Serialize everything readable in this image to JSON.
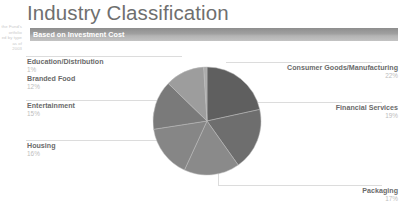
{
  "page": {
    "title": "Industry Classification",
    "subtitle": "Based on Investment Cost"
  },
  "margin_note": {
    "line1": "the Fund's",
    "line2": "ortfolio",
    "line3": "ed by type",
    "line4": "as of",
    "line5": "2003"
  },
  "colors": {
    "title": "#6f6f6f",
    "bar_dark": "#8e8e8e",
    "bar_light": "#c3c3c3",
    "label_name": "#6a6a6a",
    "label_pct": "#bdbdbd",
    "leader_line": "#dcdcdc",
    "slice_consumer_goods": "#5f5f5f",
    "slice_financial_services": "#6e6e6e",
    "slice_packaging": "#8a8a8a",
    "slice_housing": "#868686",
    "slice_entertainment": "#7a7a7a",
    "slice_branded_food": "#9d9d9d",
    "slice_education_distribution": "#acacac"
  },
  "chart_data": {
    "type": "pie",
    "title": "Industry Classification",
    "subtitle": "Based on Investment Cost",
    "unit": "%",
    "total": 102,
    "start_angle_deg": 0,
    "direction": "clockwise",
    "legend_position": "callout-labels",
    "grid": false,
    "categories": [
      "Consumer Goods/Manufacturing",
      "Financial Services",
      "Packaging",
      "Housing",
      "Entertainment",
      "Branded Food",
      "Education/Distribution"
    ],
    "values": [
      22,
      19,
      17,
      16,
      15,
      12,
      1
    ],
    "labels": [
      "Consumer Goods/Manufacturing",
      "Financial Services",
      "Packaging",
      "Housing",
      "Entertainment",
      "Branded Food",
      "Education/Distribution"
    ],
    "slices": [
      {
        "label": "Consumer Goods/Manufacturing",
        "value": 22,
        "display": "22%",
        "color": "#5f5f5f",
        "side": "right"
      },
      {
        "label": "Financial Services",
        "value": 19,
        "display": "19%",
        "color": "#6e6e6e",
        "side": "right"
      },
      {
        "label": "Packaging",
        "value": 17,
        "display": "17%",
        "color": "#8a8a8a",
        "side": "right"
      },
      {
        "label": "Housing",
        "value": 16,
        "display": "16%",
        "color": "#868686",
        "side": "left"
      },
      {
        "label": "Entertainment",
        "value": 15,
        "display": "15%",
        "color": "#7a7a7a",
        "side": "left"
      },
      {
        "label": "Branded Food",
        "value": 12,
        "display": "12%",
        "color": "#9d9d9d",
        "side": "left"
      },
      {
        "label": "Education/Distribution",
        "value": 1,
        "display": "1%",
        "color": "#acacac",
        "side": "left"
      }
    ]
  }
}
